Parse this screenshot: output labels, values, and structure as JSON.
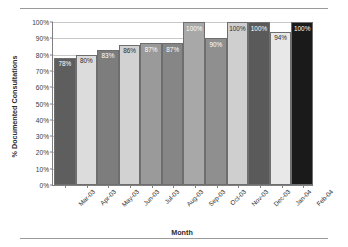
{
  "chart_data": {
    "type": "bar",
    "title": "",
    "xlabel": "Month",
    "ylabel": "% Documented Consultations",
    "ylim": [
      0,
      100
    ],
    "ytick_labels": [
      "0%",
      "10%",
      "20%",
      "30%",
      "40%",
      "50%",
      "60%",
      "70%",
      "80%",
      "90%",
      "100%"
    ],
    "ytick_values": [
      0,
      10,
      20,
      30,
      40,
      50,
      60,
      70,
      80,
      90,
      100
    ],
    "grid": true,
    "legend": "none",
    "categories": [
      "Mar-03",
      "Apr-03",
      "May-03",
      "Jun-03",
      "Jul-03",
      "Aug-03",
      "Sep-03",
      "Oct-03",
      "Nov-03",
      "Dec-03",
      "Jan-04",
      "Feb-04"
    ],
    "values": [
      78,
      80,
      83,
      86,
      87,
      87,
      100,
      90,
      100,
      100,
      94,
      100
    ],
    "data_labels": [
      "78%",
      "80%",
      "83%",
      "86%",
      "87%",
      "87%",
      "100%",
      "90%",
      "100%",
      "100%",
      "94%",
      "100%"
    ],
    "bar_colors": [
      "#5e5e5e",
      "#dcdcdc",
      "#7d7d7d",
      "#d2d2d2",
      "#9a9a9a",
      "#868686",
      "#a8a8a8",
      "#8f8f8f",
      "#cfcfcf",
      "#5a5a5a",
      "#e8e8e8",
      "#1a1a1a"
    ],
    "label_colors": [
      "#ffffff",
      "#2b2b2b",
      "#ffffff",
      "#2b2b2b",
      "#ffffff",
      "#ffffff",
      "#ffffff",
      "#ffffff",
      "#2b2b2b",
      "#ffffff",
      "#2b2b2b",
      "#ffffff"
    ]
  }
}
